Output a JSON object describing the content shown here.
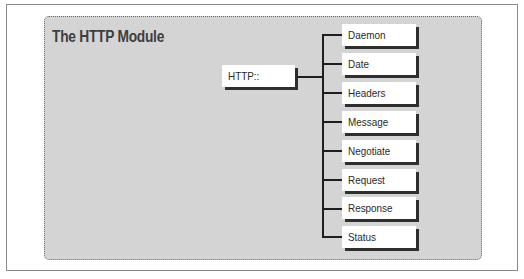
{
  "diagram": {
    "title": "The HTTP Module",
    "root": {
      "label": "HTTP::"
    },
    "children": [
      {
        "label": "Daemon"
      },
      {
        "label": "Date"
      },
      {
        "label": "Headers"
      },
      {
        "label": "Message"
      },
      {
        "label": "Negotiate"
      },
      {
        "label": "Request"
      },
      {
        "label": "Response"
      },
      {
        "label": "Status"
      }
    ],
    "colors": {
      "panel_background": "#d4d4d4",
      "node_background": "#ffffff",
      "shadow": "#2e2e2e",
      "connector": "#1e1e1e",
      "title_text": "#3e3e3e"
    }
  }
}
